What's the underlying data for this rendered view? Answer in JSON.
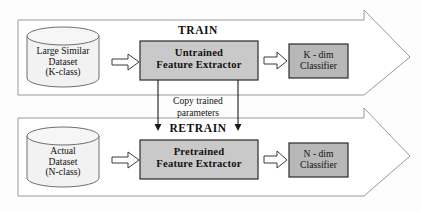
{
  "figure": {
    "type": "flowchart",
    "colors": {
      "background": "#fdfdfd",
      "outline": "#8a8a8a",
      "stroke_dark": "#1a1a1a",
      "cylinder_fill": "#f2f2f2",
      "extractor_fill": "#c9c9c9",
      "classifier_fill": "#b8b8b8",
      "small_arrow_fill": "#ffffff",
      "text": "#111111"
    }
  },
  "train_band": {
    "title": "TRAIN",
    "dataset": {
      "line1": "Large Similar",
      "line2": "Dataset",
      "line3": "(K-class)"
    },
    "extractor": {
      "line1": "Untrained",
      "line2": "Feature Extractor"
    },
    "classifier": {
      "line1": "K - dim",
      "line2": "Classifier"
    }
  },
  "transfer": {
    "line1": "Copy trained",
    "line2": "parameters"
  },
  "retrain_band": {
    "title": "RETRAIN",
    "dataset": {
      "line1": "Actual",
      "line2": "Dataset",
      "line3": "(N-class)"
    },
    "extractor": {
      "line1": "Pretrained",
      "line2": "Feature Extractor"
    },
    "classifier": {
      "line1": "N - dim",
      "line2": "Classifier"
    }
  }
}
